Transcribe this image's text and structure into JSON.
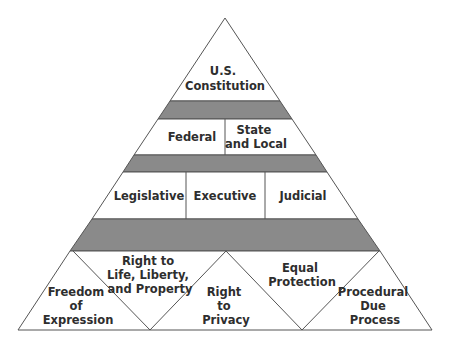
{
  "diagram": {
    "type": "pyramid",
    "colors": {
      "band": "#8a8a8a",
      "stroke": "#555555",
      "fill": "#ffffff",
      "text": "#2e2e2e"
    },
    "tiers": {
      "apex": {
        "lines": [
          "U.S.",
          "Constitution"
        ]
      },
      "government_levels": [
        {
          "lines": [
            "Federal"
          ]
        },
        {
          "lines": [
            "State",
            "and Local"
          ]
        }
      ],
      "branches": [
        {
          "lines": [
            "Legislative"
          ]
        },
        {
          "lines": [
            "Executive"
          ]
        },
        {
          "lines": [
            "Judicial"
          ]
        }
      ],
      "rights": [
        {
          "lines": [
            "Freedom",
            "of",
            "Expression"
          ]
        },
        {
          "lines": [
            "Right to",
            "Life, Liberty,",
            "and Property"
          ]
        },
        {
          "lines": [
            "Right",
            "to",
            "Privacy"
          ]
        },
        {
          "lines": [
            "Equal",
            "Protection"
          ]
        },
        {
          "lines": [
            "Procedural",
            "Due",
            "Process"
          ]
        }
      ]
    }
  }
}
